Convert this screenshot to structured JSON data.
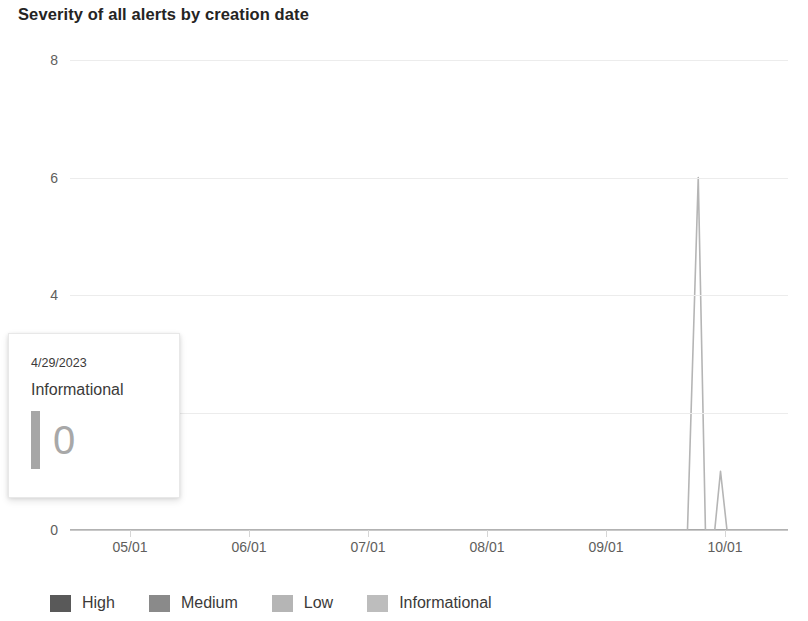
{
  "chart_title": "Severity of all alerts by creation date",
  "chart_data": {
    "type": "line",
    "title": "Severity of all alerts by creation date",
    "xlabel": "",
    "ylabel": "",
    "ylim": [
      0,
      8
    ],
    "yticks": [
      "0",
      "2",
      "4",
      "6",
      "8"
    ],
    "ytick_values": [
      0,
      2,
      4,
      6,
      8
    ],
    "grid": true,
    "legend_position": "bottom",
    "x": [
      "05/01",
      "06/01",
      "07/01",
      "08/01",
      "09/01",
      "10/01"
    ],
    "xtick_labels": [
      "05/01",
      "06/01",
      "07/01",
      "08/01",
      "09/01",
      "10/01"
    ],
    "series": [
      {
        "name": "High",
        "color": "#595959",
        "values_note": "flat at 0 across range",
        "points": []
      },
      {
        "name": "Medium",
        "color": "#8a8a8a",
        "values_note": "flat at 0 across range",
        "points": []
      },
      {
        "name": "Low",
        "color": "#b5b5b5",
        "values_note": "flat at 0 across range",
        "points": []
      },
      {
        "name": "Informational",
        "color": "#b5b5b5",
        "values_note": "flat at 0 with two spikes near 09/01",
        "points": [
          {
            "x_frac": 0.0,
            "value": 0
          },
          {
            "x_frac": 0.86,
            "value": 0
          },
          {
            "x_frac": 0.875,
            "value": 6
          },
          {
            "x_frac": 0.885,
            "value": 0
          },
          {
            "x_frac": 0.898,
            "value": 0
          },
          {
            "x_frac": 0.906,
            "value": 1
          },
          {
            "x_frac": 0.915,
            "value": 0
          },
          {
            "x_frac": 1.0,
            "value": 0
          }
        ]
      }
    ],
    "peaks": [
      {
        "label_approx_date": "mid 09",
        "value": 6
      },
      {
        "label_approx_date": "mid-late 09",
        "value": 1
      }
    ]
  },
  "tooltip": {
    "date": "4/29/2023",
    "series_name": "Informational",
    "value": "0",
    "swatch_color": "#a6a6a6"
  },
  "legend": {
    "items": [
      {
        "label": "High",
        "color": "#595959"
      },
      {
        "label": "Medium",
        "color": "#8a8a8a"
      },
      {
        "label": "Low",
        "color": "#b5b5b5"
      },
      {
        "label": "Informational",
        "color": "#bdbdbd"
      }
    ]
  }
}
